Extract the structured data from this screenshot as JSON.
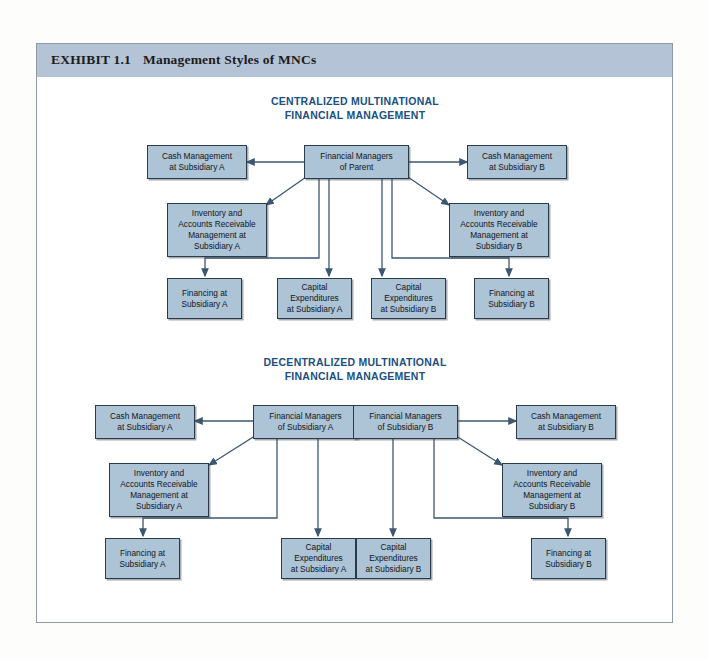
{
  "exhibit": {
    "number": "EXHIBIT 1.1",
    "title": "Management Styles of MNCs",
    "header_color": "#b4c4d6",
    "node_fill": "#adc3d6",
    "node_border": "#2c3b4a",
    "arrow_color": "#3c5772",
    "title_color": "#20507f"
  },
  "sections": [
    {
      "id": "centralized",
      "heading": "CENTRALIZED MULTINATIONAL\nFINANCIAL MANAGEMENT",
      "nodes": [
        {
          "id": "c-cash-a",
          "label": "Cash Management\nat Subsidiary A"
        },
        {
          "id": "c-parent",
          "label": "Financial Managers\nof Parent"
        },
        {
          "id": "c-cash-b",
          "label": "Cash Management\nat Subsidiary B"
        },
        {
          "id": "c-inv-a",
          "label": "Inventory and\nAccounts Receivable\nManagement at\nSubsidiary A"
        },
        {
          "id": "c-inv-b",
          "label": "Inventory and\nAccounts Receivable\nManagement at\nSubsidiary B"
        },
        {
          "id": "c-fin-a",
          "label": "Financing at\nSubsidiary A"
        },
        {
          "id": "c-capex-a",
          "label": "Capital\nExpenditures\nat Subsidiary A"
        },
        {
          "id": "c-capex-b",
          "label": "Capital\nExpenditures\nat Subsidiary B"
        },
        {
          "id": "c-fin-b",
          "label": "Financing at\nSubsidiary B"
        }
      ]
    },
    {
      "id": "decentralized",
      "heading": "DECENTRALIZED MULTINATIONAL\nFINANCIAL MANAGEMENT",
      "nodes": [
        {
          "id": "d-cash-a",
          "label": "Cash Management\nat Subsidiary A"
        },
        {
          "id": "d-mgr-a",
          "label": "Financial Managers\nof Subsidiary A"
        },
        {
          "id": "d-mgr-b",
          "label": "Financial Managers\nof Subsidiary B"
        },
        {
          "id": "d-cash-b",
          "label": "Cash Management\nat Subsidiary B"
        },
        {
          "id": "d-inv-a",
          "label": "Inventory and\nAccounts Receivable\nManagement at\nSubsidiary A"
        },
        {
          "id": "d-inv-b",
          "label": "Inventory and\nAccounts Receivable\nManagement at\nSubsidiary B"
        },
        {
          "id": "d-fin-a",
          "label": "Financing at\nSubsidiary A"
        },
        {
          "id": "d-capex-a",
          "label": "Capital\nExpenditures\nat Subsidiary A"
        },
        {
          "id": "d-capex-b",
          "label": "Capital\nExpenditures\nat Subsidiary B"
        },
        {
          "id": "d-fin-b",
          "label": "Financing at\nSubsidiary B"
        }
      ]
    }
  ]
}
